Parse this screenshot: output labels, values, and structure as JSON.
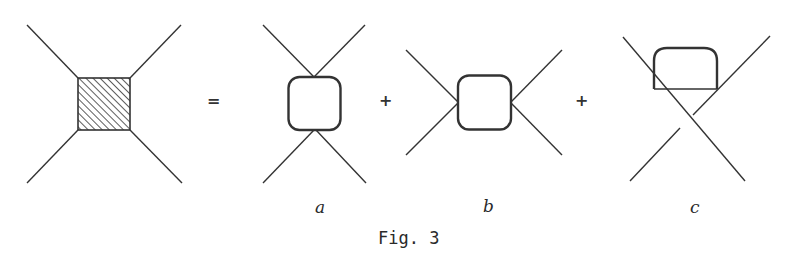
{
  "figure": {
    "caption": "Fig. 3",
    "operators": {
      "equals": "=",
      "plus1": "+",
      "plus2": "+"
    },
    "panels": [
      {
        "id": "lhs",
        "label": "",
        "description": "four-point vertex with hatched square blob"
      },
      {
        "id": "a",
        "label": "a",
        "description": "s-channel loop (rounded square, legs top and bottom)"
      },
      {
        "id": "b",
        "label": "b",
        "description": "t-channel loop (rounded square, legs left and right)"
      },
      {
        "id": "c",
        "label": "c",
        "description": "crossed diagram with loop on top"
      }
    ],
    "colors": {
      "line": "#333333",
      "background": "#ffffff"
    }
  }
}
